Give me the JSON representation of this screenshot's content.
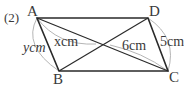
{
  "problem": {
    "number_label": "(2)"
  },
  "figure": {
    "shape": "parallelogram",
    "vertices": {
      "A": {
        "label": "A",
        "x": 37,
        "y": 18
      },
      "B": {
        "label": "B",
        "x": 59,
        "y": 71
      },
      "C": {
        "label": "C",
        "x": 168,
        "y": 71
      },
      "D": {
        "label": "D",
        "x": 148,
        "y": 18
      }
    },
    "diagonal_intersection": {
      "x": 103,
      "y": 44
    },
    "measurements": {
      "AB": "ycm",
      "AO": "xcm",
      "OC": "6cm",
      "DC": "5cm"
    },
    "colors": {
      "line": "#2a2a2a",
      "arc": "#b5b5b5",
      "text": "#3a3a3a"
    }
  }
}
